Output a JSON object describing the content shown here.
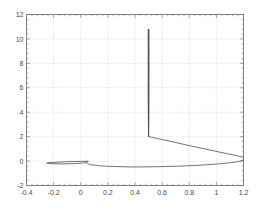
{
  "chart_data": {
    "type": "line",
    "title": "",
    "xlabel": "",
    "ylabel": "",
    "xlim": [
      -0.4,
      1.2
    ],
    "ylim": [
      -2,
      12
    ],
    "grid": true,
    "grid_style": "dotted",
    "legend": null,
    "x_ticks": [
      -0.4,
      -0.2,
      0,
      0.2,
      0.4,
      0.6,
      0.8,
      1,
      1.2
    ],
    "x_tick_labels": [
      "-0.4",
      "-0.2",
      "0",
      "0.2",
      "0.4",
      "0.6",
      "0.8",
      "1",
      "1.2"
    ],
    "y_ticks": [
      -2,
      0,
      2,
      4,
      6,
      8,
      10,
      12
    ],
    "y_tick_labels": [
      "-2",
      "0",
      "2",
      "4",
      "6",
      "8",
      "10",
      "12"
    ],
    "series": [
      {
        "name": "trajectory-spike",
        "description": "dense near-vertical oscillatory spike at x = 0.5 rising from y = 2 to y = 10.8",
        "color": "#4d4d4d",
        "x": [
          0.5,
          0.5
        ],
        "y": [
          2.0,
          10.8
        ],
        "spike_x": 0.5,
        "spike_y_bottom": 2.0,
        "spike_y_top": 10.8,
        "spike_halfwidth": 0.006,
        "spike_oscillations": 150
      },
      {
        "name": "large-lobe",
        "description": "large loop sweeping from (0.5, 2) rightward to (1.2, 0.35) and back left to (0.05, -0.05)",
        "color": "#4d4d4d",
        "points": [
          [
            0.5,
            2.0
          ],
          [
            0.62,
            1.72
          ],
          [
            0.74,
            1.42
          ],
          [
            0.86,
            1.12
          ],
          [
            0.98,
            0.84
          ],
          [
            1.08,
            0.6
          ],
          [
            1.15,
            0.44
          ],
          [
            1.195,
            0.3
          ],
          [
            1.2,
            0.12
          ],
          [
            1.17,
            -0.02
          ],
          [
            1.1,
            -0.14
          ],
          [
            0.98,
            -0.26
          ],
          [
            0.84,
            -0.36
          ],
          [
            0.68,
            -0.43
          ],
          [
            0.52,
            -0.47
          ],
          [
            0.38,
            -0.48
          ],
          [
            0.26,
            -0.45
          ],
          [
            0.16,
            -0.4
          ],
          [
            0.09,
            -0.32
          ],
          [
            0.05,
            -0.22
          ],
          [
            0.04,
            -0.12
          ],
          [
            0.045,
            -0.05
          ]
        ]
      },
      {
        "name": "small-lobe",
        "description": "thin elongated loop from (0.05, 0) leftward to tip at (-0.25, -0.02) and back",
        "color": "#4d4d4d",
        "points": [
          [
            0.05,
            -0.02
          ],
          [
            -0.02,
            -0.03
          ],
          [
            -0.09,
            -0.05
          ],
          [
            -0.15,
            -0.08
          ],
          [
            -0.2,
            -0.11
          ],
          [
            -0.235,
            -0.14
          ],
          [
            -0.25,
            -0.16
          ],
          [
            -0.248,
            -0.18
          ],
          [
            -0.23,
            -0.2
          ],
          [
            -0.19,
            -0.22
          ],
          [
            -0.13,
            -0.23
          ],
          [
            -0.06,
            -0.21
          ],
          [
            0.0,
            -0.17
          ],
          [
            0.035,
            -0.12
          ],
          [
            0.05,
            -0.06
          ],
          [
            0.05,
            -0.02
          ]
        ]
      }
    ],
    "colors": {
      "axis": "#808080",
      "grid": "#c8c8c8",
      "line": "#4d4d4d",
      "background": "#ffffff",
      "tick_text": "#4a4a4a"
    }
  }
}
